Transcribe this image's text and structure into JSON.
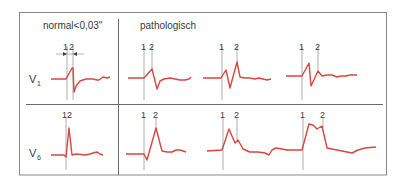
{
  "header": {
    "normal_label": "normal<0,03\"",
    "pathologic_label": "pathologisch"
  },
  "leads": {
    "v1": {
      "letter": "V",
      "sub": "1"
    },
    "v6": {
      "letter": "V",
      "sub": "6"
    }
  },
  "markers": {
    "one": "1",
    "two": "2",
    "one_two": "12"
  },
  "colors": {
    "waveform": "#d9453f",
    "marker_line": "#9a9a9a",
    "frame": "#7a7a7a",
    "text": "#3a3a3a"
  },
  "panels": [
    {
      "lead": "V1",
      "group": "normal",
      "markers": [
        "1",
        "2"
      ]
    },
    {
      "lead": "V1",
      "group": "pathologisch",
      "markers": [
        "1",
        "2"
      ]
    },
    {
      "lead": "V1",
      "group": "pathologisch",
      "markers": [
        "1",
        "2"
      ]
    },
    {
      "lead": "V1",
      "group": "pathologisch",
      "markers": [
        "1",
        "2"
      ]
    },
    {
      "lead": "V6",
      "group": "normal",
      "markers": [
        "12"
      ]
    },
    {
      "lead": "V6",
      "group": "pathologisch",
      "markers": [
        "1",
        "2"
      ]
    },
    {
      "lead": "V6",
      "group": "pathologisch",
      "markers": [
        "1",
        "2"
      ]
    },
    {
      "lead": "V6",
      "group": "pathologisch",
      "markers": [
        "1",
        "2"
      ]
    }
  ]
}
